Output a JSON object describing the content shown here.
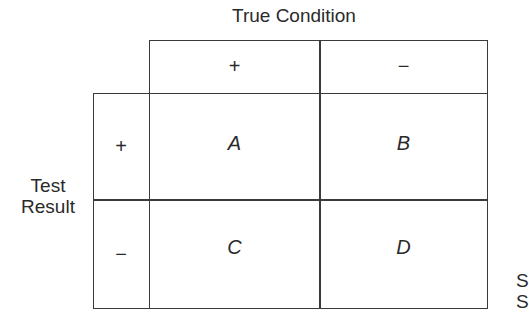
{
  "diagram": {
    "title": "True Condition",
    "row_label_line1": "Test",
    "row_label_line2": "Result",
    "column_headers": [
      "+",
      "−"
    ],
    "row_headers": [
      "+",
      "−"
    ],
    "cells": [
      [
        "A",
        "B"
      ],
      [
        "C",
        "D"
      ]
    ],
    "cropped_fragment": [
      "S",
      "S"
    ]
  }
}
